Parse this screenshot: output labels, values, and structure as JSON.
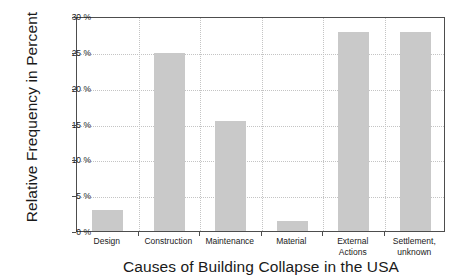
{
  "chart_data": {
    "type": "bar",
    "title": "",
    "xlabel": "Causes of Building Collapse in the USA",
    "ylabel": "Relative Frequency in Percent",
    "categories": [
      "Design",
      "Construction",
      "Maintenance",
      "Material",
      "External Actions",
      "Settlement, unknown"
    ],
    "category_labels_display": [
      "Design",
      "Construction",
      "Maintenance",
      "Material",
      "External\nActions",
      "Settlement,\nunknown"
    ],
    "values": [
      2.9,
      24.8,
      15.3,
      1.4,
      27.7,
      27.7
    ],
    "ylim": [
      0,
      30
    ],
    "yticks": [
      0,
      5,
      10,
      15,
      20,
      25,
      30
    ],
    "ytick_labels": [
      "0 %",
      "5 %",
      "10 %",
      "15 %",
      "20 %",
      "25 %",
      "30 %"
    ],
    "grid": true,
    "legend": "none",
    "bar_color": "#c9c9c9",
    "axis_color": "#4d4d4d",
    "grid_color": "#c4c4c4",
    "background": "#ffffff"
  }
}
